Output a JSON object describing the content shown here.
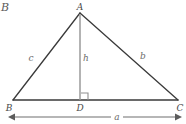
{
  "figure": {
    "kind": "geometry-diagram",
    "background_color": "#ffffff",
    "corner_mark": "B",
    "triangle": {
      "stroke_color": "#3a3a3a",
      "stroke_width": 1.3,
      "vertices": [
        {
          "name": "A",
          "label": "A",
          "x": 80,
          "y": 13
        },
        {
          "name": "B",
          "label": "B",
          "x": 13,
          "y": 100
        },
        {
          "name": "C",
          "label": "C",
          "x": 178,
          "y": 100
        }
      ]
    },
    "altitude": {
      "label": "h",
      "stroke_color": "#9a9a9a",
      "stroke_width": 1.4,
      "from": {
        "x": 80,
        "y": 13
      },
      "to": {
        "x": 80,
        "y": 100
      },
      "foot": {
        "name": "D",
        "label": "D",
        "x": 80,
        "y": 100
      }
    },
    "right_angle": {
      "name": "right-angle-at-D",
      "x": 80,
      "y": 100,
      "size": 7,
      "stroke_color": "#8f8f8f"
    },
    "side_labels": [
      {
        "key": "c",
        "label": "c",
        "x": 31,
        "y": 58
      },
      {
        "key": "h",
        "label": "h",
        "x": 85,
        "y": 58
      },
      {
        "key": "b",
        "label": "b",
        "x": 143,
        "y": 56
      }
    ],
    "vertex_labels": [
      {
        "key": "A",
        "label": "A",
        "x": 80,
        "y": 6
      },
      {
        "key": "B",
        "label": "B",
        "x": 10,
        "y": 107
      },
      {
        "key": "C",
        "label": "C",
        "x": 180,
        "y": 107
      },
      {
        "key": "D",
        "label": "D",
        "x": 79,
        "y": 107
      }
    ],
    "base_measure": {
      "label": "a",
      "label_x": 117,
      "label_y": 116,
      "line_y": 117,
      "left_x": 9,
      "right_x": 181,
      "stroke_color": "#6e6e6e",
      "stroke_width": 1.1,
      "arrowhead_size": 5
    }
  }
}
